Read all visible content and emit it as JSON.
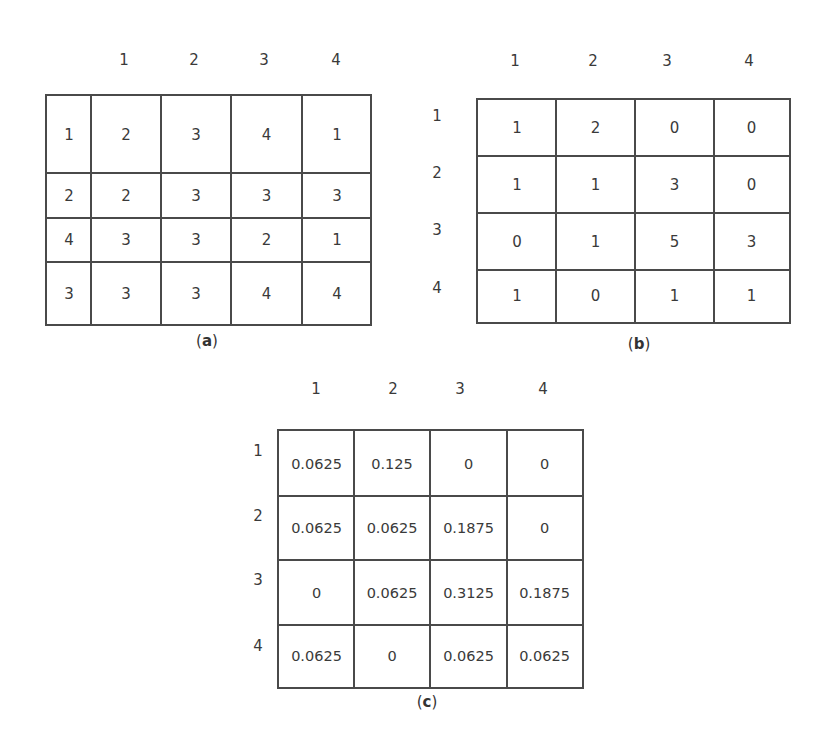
{
  "figure_a": {
    "caption_letter": "a",
    "column_headers": [
      "1",
      "2",
      "3",
      "4"
    ],
    "rows": [
      [
        "1",
        "2",
        "3",
        "4",
        "1"
      ],
      [
        "2",
        "2",
        "3",
        "3",
        "3"
      ],
      [
        "4",
        "3",
        "3",
        "2",
        "1"
      ],
      [
        "3",
        "3",
        "3",
        "4",
        "4"
      ]
    ]
  },
  "figure_b": {
    "caption_letter": "b",
    "column_headers": [
      "1",
      "2",
      "3",
      "4"
    ],
    "row_headers": [
      "1",
      "2",
      "3",
      "4"
    ],
    "rows": [
      [
        "1",
        "2",
        "0",
        "0"
      ],
      [
        "1",
        "1",
        "3",
        "0"
      ],
      [
        "0",
        "1",
        "5",
        "3"
      ],
      [
        "1",
        "0",
        "1",
        "1"
      ]
    ]
  },
  "figure_c": {
    "caption_letter": "c",
    "column_headers": [
      "1",
      "2",
      "3",
      "4"
    ],
    "row_headers": [
      "1",
      "2",
      "3",
      "4"
    ],
    "rows": [
      [
        "0.0625",
        "0.125",
        "0",
        "0"
      ],
      [
        "0.0625",
        "0.0625",
        "0.1875",
        "0"
      ],
      [
        "0",
        "0.0625",
        "0.3125",
        "0.1875"
      ],
      [
        "0.0625",
        "0",
        "0.0625",
        "0.0625"
      ]
    ]
  },
  "colors": {
    "line": "#4a4a4a",
    "text": "#3a3a3a",
    "background": "#ffffff"
  }
}
